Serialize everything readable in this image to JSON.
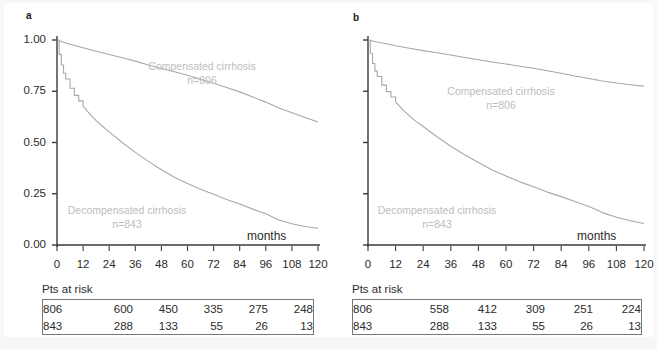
{
  "figure": {
    "background_color": "#ffffff",
    "axis_color": "#3a3a3a",
    "curve_color": "#a8a8a8",
    "annotation_color": "#bdbdbd",
    "text_color": "#2b2b2b",
    "table_border_color": "#777777"
  },
  "panels": [
    {
      "label": "a",
      "x_axis_title": "months",
      "y_tick_labels": [
        "1.00",
        "0.75",
        "0.50",
        "0.25",
        "0.00"
      ],
      "y_tick_values": [
        1.0,
        0.75,
        0.5,
        0.25,
        0.0
      ],
      "show_y_tick_labels": true,
      "x_tick_labels": [
        "0",
        "12",
        "24",
        "36",
        "48",
        "60",
        "72",
        "84",
        "96",
        "108",
        "120"
      ],
      "annotations": [
        {
          "name": "compensated",
          "line1": "Compensated cirrhosis",
          "line2": "n=806"
        },
        {
          "name": "decompensated",
          "line1": "Decompensated cirrhosis",
          "line2": "n=843"
        }
      ],
      "risk_table": {
        "caption": "Pts at risk",
        "rows": [
          [
            "806",
            "600",
            "450",
            "335",
            "275",
            "248"
          ],
          [
            "843",
            "288",
            "133",
            "55",
            "26",
            "13"
          ]
        ]
      }
    },
    {
      "label": "b",
      "x_axis_title": "months",
      "y_tick_labels": [],
      "y_tick_values": [
        1.0,
        0.75,
        0.5,
        0.25,
        0.0
      ],
      "show_y_tick_labels": false,
      "x_tick_labels": [
        "0",
        "12",
        "24",
        "36",
        "48",
        "60",
        "72",
        "84",
        "96",
        "108",
        "120"
      ],
      "annotations": [
        {
          "name": "compensated",
          "line1": "Compensated cirrhosis",
          "line2": "n=806"
        },
        {
          "name": "decompensated",
          "line1": "Decompensated cirrhosis",
          "line2": "n=843"
        }
      ],
      "risk_table": {
        "caption": "Pts at risk",
        "rows": [
          [
            "806",
            "558",
            "412",
            "309",
            "251",
            "224"
          ],
          [
            "843",
            "288",
            "133",
            "55",
            "26",
            "13"
          ]
        ]
      }
    }
  ],
  "chart_data": [
    {
      "panel": "a",
      "type": "line",
      "title": "",
      "xlabel": "months",
      "ylabel": "",
      "xlim": [
        0,
        120
      ],
      "ylim": [
        0,
        1
      ],
      "grid": false,
      "legend_position": "inline-annotations",
      "xticks": [
        0,
        12,
        24,
        36,
        48,
        60,
        72,
        84,
        96,
        108,
        120
      ],
      "yticks": [
        0.0,
        0.25,
        0.5,
        0.75,
        1.0
      ],
      "series": [
        {
          "name": "Compensated cirrhosis",
          "n": 806,
          "x": [
            0,
            4,
            8,
            12,
            18,
            24,
            30,
            36,
            42,
            48,
            54,
            60,
            66,
            72,
            78,
            84,
            90,
            96,
            102,
            108,
            114,
            120
          ],
          "y": [
            1.0,
            0.985,
            0.973,
            0.962,
            0.945,
            0.929,
            0.913,
            0.897,
            0.878,
            0.861,
            0.845,
            0.828,
            0.808,
            0.789,
            0.768,
            0.747,
            0.722,
            0.697,
            0.668,
            0.645,
            0.622,
            0.6
          ]
        },
        {
          "name": "Decompensated cirrhosis",
          "n": 843,
          "x": [
            0,
            1,
            2,
            3,
            4,
            6,
            8,
            10,
            12,
            15,
            18,
            21,
            24,
            30,
            36,
            42,
            48,
            54,
            60,
            66,
            72,
            78,
            84,
            90,
            96,
            102,
            108,
            114,
            120
          ],
          "y": [
            1.0,
            0.93,
            0.878,
            0.838,
            0.81,
            0.765,
            0.73,
            0.703,
            0.678,
            0.64,
            0.607,
            0.578,
            0.552,
            0.5,
            0.452,
            0.408,
            0.367,
            0.33,
            0.3,
            0.272,
            0.248,
            0.222,
            0.2,
            0.175,
            0.152,
            0.122,
            0.104,
            0.09,
            0.082
          ]
        }
      ]
    },
    {
      "panel": "b",
      "type": "line",
      "title": "",
      "xlabel": "months",
      "ylabel": "",
      "xlim": [
        0,
        120
      ],
      "ylim": [
        0,
        1
      ],
      "grid": false,
      "legend_position": "inline-annotations",
      "xticks": [
        0,
        12,
        24,
        36,
        48,
        60,
        72,
        84,
        96,
        108,
        120
      ],
      "yticks": [
        0.0,
        0.25,
        0.5,
        0.75,
        1.0
      ],
      "series": [
        {
          "name": "Compensated cirrhosis",
          "n": 806,
          "x": [
            0,
            4,
            8,
            12,
            18,
            24,
            30,
            36,
            42,
            48,
            54,
            60,
            66,
            72,
            78,
            84,
            90,
            96,
            102,
            108,
            114,
            120
          ],
          "y": [
            1.0,
            0.99,
            0.982,
            0.972,
            0.96,
            0.948,
            0.938,
            0.927,
            0.915,
            0.904,
            0.893,
            0.883,
            0.872,
            0.862,
            0.85,
            0.838,
            0.824,
            0.812,
            0.8,
            0.79,
            0.782,
            0.775
          ]
        },
        {
          "name": "Decompensated cirrhosis",
          "n": 843,
          "x": [
            0,
            1,
            2,
            3,
            4,
            6,
            8,
            10,
            12,
            15,
            18,
            21,
            24,
            30,
            36,
            42,
            48,
            54,
            60,
            66,
            72,
            78,
            84,
            90,
            96,
            102,
            108,
            114,
            120
          ],
          "y": [
            1.0,
            0.935,
            0.885,
            0.848,
            0.822,
            0.78,
            0.748,
            0.722,
            0.698,
            0.662,
            0.63,
            0.602,
            0.578,
            0.528,
            0.482,
            0.44,
            0.402,
            0.366,
            0.336,
            0.308,
            0.284,
            0.258,
            0.236,
            0.212,
            0.188,
            0.158,
            0.135,
            0.118,
            0.105
          ]
        }
      ]
    }
  ]
}
